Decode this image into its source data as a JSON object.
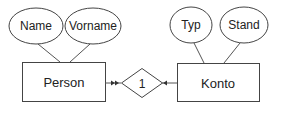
{
  "diagram": {
    "type": "entity-relationship",
    "entities": [
      {
        "id": "person",
        "label": "Person",
        "attributes": [
          "Name",
          "Vorname"
        ]
      },
      {
        "id": "konto",
        "label": "Konto",
        "attributes": [
          "Typ",
          "Stand"
        ]
      }
    ],
    "relationships": [
      {
        "id": "rel1",
        "label": "1",
        "from": "person",
        "to": "konto"
      }
    ],
    "colors": {
      "stroke": "#333333",
      "background": "#ffffff",
      "text": "#222222"
    }
  }
}
